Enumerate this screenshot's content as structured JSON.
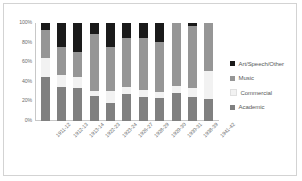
{
  "chart_data": {
    "type": "bar",
    "stacked": true,
    "stack_mode": "percent",
    "title": "",
    "xlabel": "",
    "ylabel": "",
    "ylim": [
      0,
      100
    ],
    "yticks": [
      "0%",
      "20%",
      "40%",
      "60%",
      "80%",
      "100%"
    ],
    "ytick_values": [
      0,
      20,
      40,
      60,
      80,
      100
    ],
    "grid": false,
    "legend_position": "right",
    "categories": [
      "1911-12",
      "1912-13",
      "1913-14",
      "1922-23",
      "1923-24",
      "1926-27",
      "1928-29",
      "1929-30",
      "1930-31",
      "1938-39",
      "1941-42"
    ],
    "series": [
      {
        "name": "Academic",
        "color": "#808080",
        "values": [
          45,
          35,
          34,
          26,
          18,
          28,
          24,
          23,
          29,
          24,
          22
        ]
      },
      {
        "name": "Commercial",
        "color": "#f2f2f2",
        "values": [
          19,
          12,
          11,
          5,
          13,
          7,
          8,
          7,
          7,
          10,
          29
        ]
      },
      {
        "name": "Music",
        "color": "#969696",
        "values": [
          29,
          29,
          25,
          58,
          45,
          50,
          53,
          51,
          64,
          63,
          49
        ]
      },
      {
        "name": "Art/Speech/Other",
        "color": "#1a1a1a",
        "values": [
          7,
          24,
          30,
          11,
          24,
          15,
          15,
          19,
          0,
          3,
          0
        ]
      }
    ]
  },
  "legend": {
    "items": [
      {
        "label": "Art/Speech/Other",
        "color": "#1a1a1a"
      },
      {
        "label": "Music",
        "color": "#969696"
      },
      {
        "label": "Commercial",
        "color": "#f2f2f2"
      },
      {
        "label": "Academic",
        "color": "#808080"
      }
    ]
  }
}
